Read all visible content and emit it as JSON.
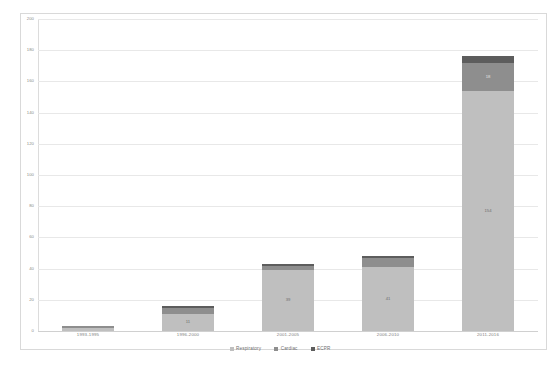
{
  "chart_data": {
    "type": "bar",
    "subtype": "stacked-bar",
    "title": "",
    "subtitle": "",
    "xlabel": "",
    "ylabel": "",
    "ylim": [
      0,
      200
    ],
    "ytick_step": 20,
    "grid": true,
    "legend_position": "bottom",
    "categories": [
      "1993-1995",
      "1996-2000",
      "2001-2005",
      "2006-2010",
      "2011-2016"
    ],
    "yticks": [
      "0",
      "20",
      "40",
      "60",
      "80",
      "100",
      "120",
      "140",
      "160",
      "180",
      "200"
    ],
    "series": [
      {
        "name": "Respiratory",
        "color": "#bfbfbf",
        "values": [
          2,
          11,
          39,
          41,
          154
        ],
        "labels": [
          "",
          "11",
          "39",
          "41",
          "154"
        ]
      },
      {
        "name": "Cardiac",
        "color": "#8e8e8e",
        "values": [
          1,
          4,
          3,
          6,
          18
        ],
        "labels": [
          "",
          "",
          "",
          "",
          "18"
        ]
      },
      {
        "name": "ECPR",
        "color": "#5d5d5d",
        "values": [
          0,
          1,
          1,
          1,
          4
        ],
        "labels": [
          "",
          "",
          "",
          "",
          ""
        ]
      }
    ],
    "totals": [
      3,
      16,
      43,
      48,
      176
    ]
  },
  "legend": {
    "items": [
      {
        "label": "Respiratory",
        "color": "#bfbfbf"
      },
      {
        "label": "Cardiac",
        "color": "#8e8e8e"
      },
      {
        "label": "ECPR",
        "color": "#5d5d5d"
      }
    ]
  }
}
